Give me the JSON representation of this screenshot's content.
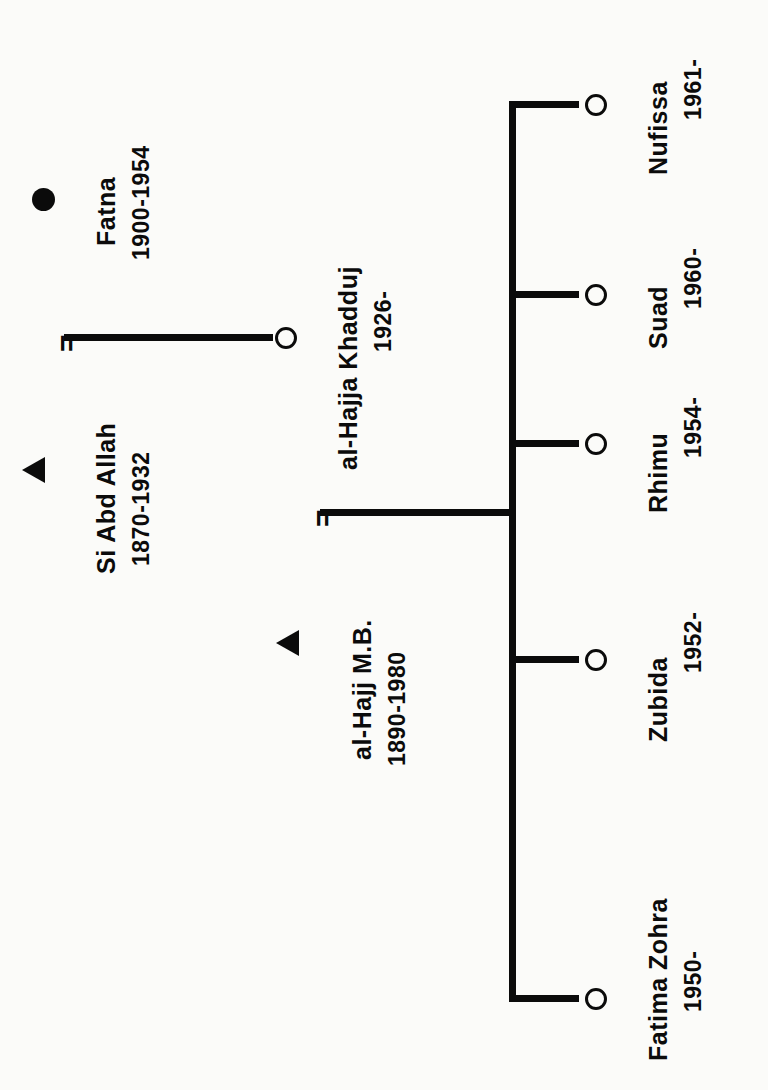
{
  "diagram": {
    "type": "kinship-genealogy-chart",
    "orientation": "rotated-90-ccw",
    "ink_color": "#0b0b0b",
    "background_color": "#fbfbf9"
  },
  "symbols": {
    "male": "filled-triangle",
    "female_open": "open-circle",
    "female_filled": "filled-circle",
    "marriage": "=",
    "descent": "line"
  },
  "generation1": {
    "husband": {
      "name": "Si Abd Allah",
      "dates": "1870-1932",
      "symbol": "triangle-icon",
      "sex": "male"
    },
    "wife": {
      "name": "Fatna",
      "dates": "1900-1954",
      "symbol": "filled-circle-icon",
      "sex": "female"
    },
    "marriage_mark": "="
  },
  "generation2": {
    "husband": {
      "name": "al-Hajj M.B.",
      "dates": "1890-1980",
      "symbol": "triangle-icon",
      "sex": "male"
    },
    "wife": {
      "name": "al-Hajja Khadduj",
      "dates": "1926-",
      "symbol": "open-circle-icon",
      "sex": "female"
    },
    "marriage_mark": "="
  },
  "children": [
    {
      "name": "Fatima Zohra",
      "dates": "1950-",
      "symbol": "open-circle-icon",
      "sex": "female"
    },
    {
      "name": "Zubida",
      "dates": "1952-",
      "symbol": "open-circle-icon",
      "sex": "female"
    },
    {
      "name": "Rhimu",
      "dates": "1954-",
      "symbol": "open-circle-icon",
      "sex": "female"
    },
    {
      "name": "Suad",
      "dates": "1960-",
      "symbol": "open-circle-icon",
      "sex": "female"
    },
    {
      "name": "Nufissa",
      "dates": "1961-",
      "symbol": "open-circle-icon",
      "sex": "female"
    }
  ]
}
